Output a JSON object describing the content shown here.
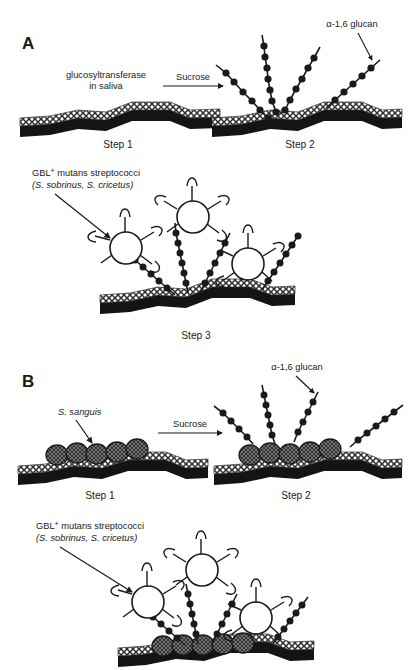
{
  "figure": {
    "title_text_present": false,
    "width": 414,
    "height": 670,
    "background_color": "#ffffff",
    "ink_color": "#1a1a1a"
  },
  "panels": [
    {
      "letter": "A",
      "steps": [
        {
          "label": "Step 1"
        },
        {
          "label": "Step 2"
        },
        {
          "label": "Step 3"
        }
      ],
      "labels": {
        "enzyme_line1": "glucosyltransferase",
        "enzyme_line2": "in saliva",
        "reaction_arrow": "Sucrose",
        "glucan": "α-1,6 glucan",
        "bacteria_line1_main": "GBL",
        "bacteria_line1_sup": "+",
        "bacteria_line1_rest": " mutans streptococci",
        "bacteria_line2": "(S. sobrinus, S. cricetus)"
      }
    },
    {
      "letter": "B",
      "steps": [
        {
          "label": "Step 1"
        },
        {
          "label": "Step 2"
        }
      ],
      "labels": {
        "sanguis": "S. sanguis",
        "reaction_arrow": "Sucrose",
        "glucan": "α-1,6 glucan",
        "bacteria_line1_main": "GBL",
        "bacteria_line1_sup": "+",
        "bacteria_line1_rest": " mutans streptococci",
        "bacteria_line2": "(S. sobrinus, S. cricetus)"
      }
    }
  ],
  "legend_elements": {
    "enamel_surface": "enamel-surface-black-band",
    "pellicle": "salivary-pellicle-hatched-band",
    "glucan_chain": "beaded-glucan-chain",
    "mutans_cell": "open-circle-cell-with-glucan-binding-lectin-receptors",
    "sanguis_cell": "stippled-oval-cell"
  },
  "colors": {
    "ink": "#1a1a1a",
    "pellicle_fill": "#ffffff",
    "pellicle_hatch": "#2b2b2b",
    "sanguis_fill": "#8d8d8d",
    "sanguis_hatch": "#3a3a3a",
    "cell_fill": "#ffffff"
  }
}
